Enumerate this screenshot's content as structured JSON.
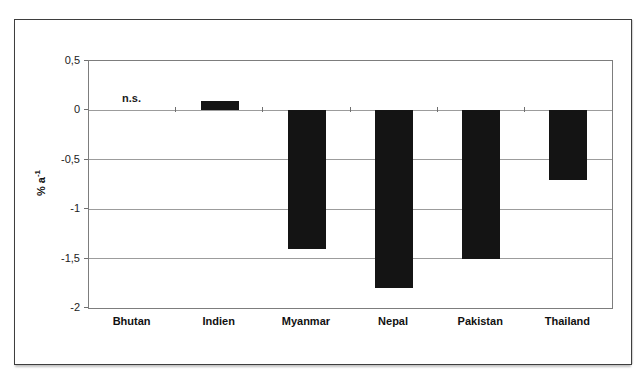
{
  "figure": {
    "background_color": "#ffffff",
    "frame_color": "#3e3e3e"
  },
  "chart_data": {
    "type": "bar",
    "title": "",
    "categories": [
      "Bhutan",
      "Indien",
      "Myanmar",
      "Nepal",
      "Pakistan",
      "Thailand"
    ],
    "values": [
      null,
      0.1,
      -1.4,
      -1.8,
      -1.5,
      -0.7
    ],
    "annotations": [
      {
        "category": "Bhutan",
        "text": "n.s."
      }
    ],
    "ylabel_prefix": "% a",
    "ylabel_sup": "-1",
    "yticks": [
      0.5,
      0,
      -0.5,
      -1,
      -1.5,
      -2
    ],
    "ytick_labels": [
      "0,5",
      "0",
      "-0,5",
      "-1",
      "-1,5",
      "-2"
    ],
    "ylim": [
      -2,
      0.5
    ],
    "xlabel": "",
    "grid": true,
    "legend": null,
    "bar_color": "#141414",
    "gridline_color": "#9c9c9c",
    "axis_tick_color": "#6f6f6f"
  }
}
